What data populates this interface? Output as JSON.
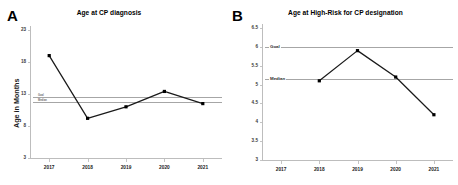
{
  "figure": {
    "panels": [
      {
        "letter": "A",
        "title": "Age at CP diagnosis",
        "ylabel": "Age in Months"
      },
      {
        "letter": "B",
        "title": "Age at High-Risk for CP designation",
        "ylabel": ""
      }
    ]
  },
  "chart_data": [
    {
      "type": "line",
      "panel": "A",
      "title": "Age at CP diagnosis",
      "xlabel": "",
      "ylabel": "Age in Months",
      "categories": [
        "2017",
        "2018",
        "2019",
        "2020",
        "2021"
      ],
      "values": [
        19.0,
        9.2,
        11.0,
        13.4,
        11.5
      ],
      "ylim": [
        3,
        23
      ],
      "yticks": [
        3,
        8,
        13,
        18,
        23
      ],
      "yticklabels": [
        "3",
        "8",
        "13",
        "18",
        "23"
      ],
      "grid": false,
      "legend": "none",
      "annotations": [
        {
          "label": "Goal",
          "value": 12.5,
          "type": "reference-line"
        },
        {
          "label": "Median",
          "value": 11.7,
          "type": "reference-line"
        }
      ]
    },
    {
      "type": "line",
      "panel": "B",
      "title": "Age at High-Risk for CP designation",
      "xlabel": "",
      "ylabel": "",
      "categories": [
        "2017",
        "2018",
        "2019",
        "2020",
        "2021"
      ],
      "values": [
        null,
        5.1,
        5.9,
        5.2,
        4.2
      ],
      "ylim": [
        3,
        6.5
      ],
      "yticks": [
        3,
        3.5,
        4,
        4.5,
        5,
        5.5,
        6,
        6.5
      ],
      "yticklabels": [
        "3",
        "3.5",
        "4",
        "4.5",
        "5",
        "5.5",
        "6",
        "6.5"
      ],
      "grid": false,
      "legend": "none",
      "annotations": [
        {
          "label": "Goal",
          "value": 6.0,
          "type": "reference-line"
        },
        {
          "label": "Median",
          "value": 5.15,
          "type": "reference-line"
        }
      ]
    }
  ],
  "colors": {
    "line": "#1a1a1a",
    "marker": "#000000",
    "reference_line": "#a6a6a6",
    "axis": "#bdbdbd",
    "background": "#ffffff"
  }
}
